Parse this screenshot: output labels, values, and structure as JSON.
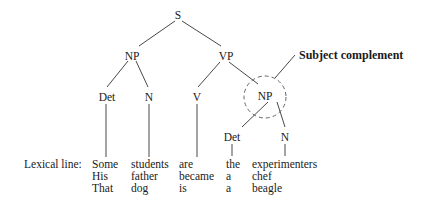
{
  "diagram": {
    "type": "syntax-tree",
    "nodes": {
      "s": "S",
      "np_subject": "NP",
      "vp": "VP",
      "det_subject": "Det",
      "n_subject": "N",
      "v": "V",
      "np_complement": "NP",
      "det_complement": "Det",
      "n_complement": "N"
    },
    "annotation": "Subject complement",
    "lexical_label": "Lexical line:",
    "lexical_columns": [
      {
        "category": "Det",
        "words": [
          "Some",
          "His",
          "That"
        ]
      },
      {
        "category": "N",
        "words": [
          "students",
          "father",
          "dog"
        ]
      },
      {
        "category": "V",
        "words": [
          "are",
          "became",
          "is"
        ]
      },
      {
        "category": "Det",
        "words": [
          "the",
          "a",
          "a"
        ]
      },
      {
        "category": "N",
        "words": [
          "experimenters",
          "chef",
          "beagle"
        ]
      }
    ]
  }
}
